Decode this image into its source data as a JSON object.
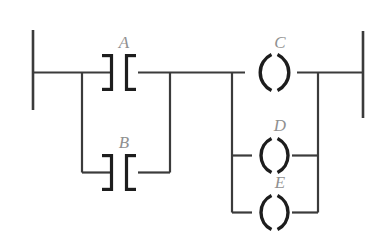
{
  "diagram": {
    "type": "ladder-logic",
    "background_color": "#ffffff",
    "line_color": "#3b3b3b",
    "symbol_color": "#1d1d1d",
    "label_color": "#909090",
    "rails": {
      "left_label": "L1",
      "right_label": "L2"
    },
    "devices": [
      {
        "id": "A",
        "label": "A",
        "kind": "contact",
        "branch": "input",
        "position": "top"
      },
      {
        "id": "B",
        "label": "B",
        "kind": "contact",
        "branch": "input",
        "position": "bottom"
      },
      {
        "id": "C",
        "label": "C",
        "kind": "coil",
        "branch": "output",
        "position": "top"
      },
      {
        "id": "D",
        "label": "D",
        "kind": "coil",
        "branch": "output",
        "position": "middle"
      },
      {
        "id": "E",
        "label": "E",
        "kind": "coil",
        "branch": "output",
        "position": "bottom"
      }
    ],
    "logic": {
      "inputs_parallel": [
        "A",
        "B"
      ],
      "outputs_parallel": [
        "C",
        "D",
        "E"
      ],
      "expression": "(A OR B) -> C, D, E"
    }
  }
}
